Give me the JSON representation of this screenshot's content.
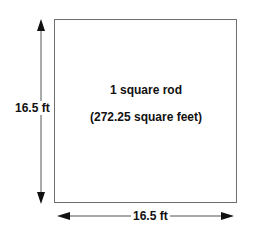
{
  "diagram": {
    "area_label": "1 square rod",
    "area_sub_label": "(272.25 square feet)",
    "height_label": "16.5 ft",
    "width_label": "16.5 ft",
    "colors": {
      "line": "#6e6e6e",
      "arrow": "#111111",
      "text": "#111111"
    }
  }
}
